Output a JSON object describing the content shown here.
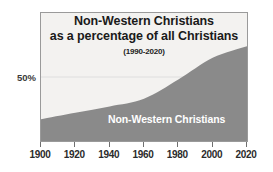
{
  "chart_data": {
    "type": "area",
    "title": "Non-Western Christians as a percentage of all Christians",
    "title_lines": [
      "Non-Western Christians",
      "as a percentage of all Christians"
    ],
    "subtitle": "(1990-2020)",
    "series_label": "Non-Western Christians",
    "xlabel": "",
    "ylabel": "",
    "xlim": [
      1900,
      2020
    ],
    "ylim": [
      0,
      100
    ],
    "grid": true,
    "legend_position": "inside-area",
    "x_tick_labels": [
      "1900",
      "1920",
      "1940",
      "1960",
      "1980",
      "2000",
      "2020"
    ],
    "x": [
      1900,
      1920,
      1940,
      1960,
      1980,
      2000,
      2020
    ],
    "y_tick_labels": [
      "50%"
    ],
    "y_ticks": [
      50
    ],
    "series": [
      {
        "name": "Non-Western Christians",
        "values": [
          17,
          22,
          27,
          33,
          48,
          65,
          74
        ]
      }
    ],
    "colors": {
      "area_fill": "#8a8a8a",
      "plot_background": "#f3f2f0",
      "frame": "#9a9a9a",
      "gridline": "#dedede",
      "title_text": "#1a1a1a",
      "series_label_text": "#ffffff",
      "axis_text": "#2b2b2b"
    }
  }
}
